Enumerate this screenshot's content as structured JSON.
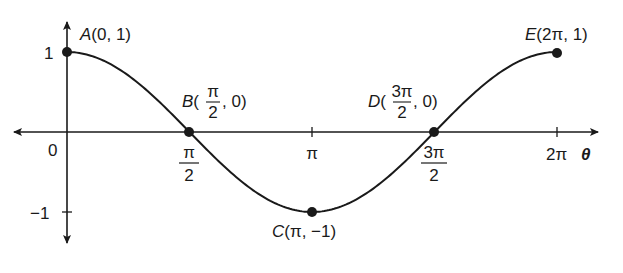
{
  "chart_data": {
    "type": "line",
    "title": "",
    "function": "cos(theta)",
    "xlabel": "θ",
    "ylabel": "",
    "x_ticks": [
      {
        "value": 0,
        "label": "0"
      },
      {
        "value": 1.5708,
        "label_num": "π",
        "label_den": "2"
      },
      {
        "value": 3.1416,
        "label": "π"
      },
      {
        "value": 4.7124,
        "label_num": "3π",
        "label_den": "2"
      },
      {
        "value": 6.2832,
        "label": "2π"
      }
    ],
    "y_ticks": [
      {
        "value": 1,
        "label": "1"
      },
      {
        "value": -1,
        "label": "−1"
      }
    ],
    "xlim": [
      -0.4,
      6.8
    ],
    "ylim": [
      -1.4,
      1.4
    ],
    "grid": false,
    "points": [
      {
        "name": "A",
        "x": 0,
        "y": 1,
        "label": "A(0, 1)"
      },
      {
        "name": "B",
        "x": 1.5708,
        "y": 0,
        "label_pre": "B(",
        "label_num": "π",
        "label_den": "2",
        "label_post": ", 0)"
      },
      {
        "name": "C",
        "x": 3.1416,
        "y": -1,
        "label": "C(π, −1)"
      },
      {
        "name": "D",
        "x": 4.7124,
        "y": 0,
        "label_pre": "D(",
        "label_num": "3π",
        "label_den": "2",
        "label_post": ", 0)"
      },
      {
        "name": "E",
        "x": 6.2832,
        "y": 1,
        "label": "E(2π, 1)"
      }
    ],
    "colors": {
      "curve": "#1a1a1a",
      "axes": "#1a1a1a"
    }
  }
}
